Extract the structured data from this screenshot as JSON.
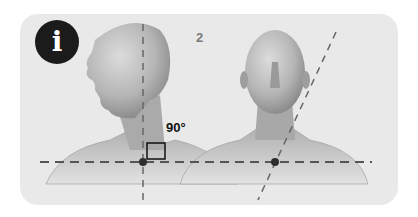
{
  "badge": {
    "icon": "info-icon",
    "glyph": "i",
    "color": "#1b1b1b"
  },
  "step_number": "2",
  "angle_label": "90°",
  "figures": [
    {
      "name": "head-profile-view",
      "view": "side"
    },
    {
      "name": "head-front-view",
      "view": "front"
    }
  ],
  "colors": {
    "card_background": "#e9e9e9",
    "guide_lines": "#555555",
    "marker": "#2d2d2d",
    "skin_light": "#c8c8c8",
    "skin_dark": "#8e8e8e"
  }
}
